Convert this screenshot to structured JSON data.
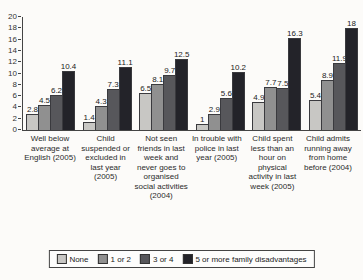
{
  "chart_data": {
    "type": "bar",
    "title": "",
    "xlabel": "",
    "ylabel": "",
    "ylim": [
      0,
      20
    ],
    "ytick_step": 2,
    "grid": false,
    "legend_position": "bottom",
    "data_labels": true,
    "categories": [
      "Well below average at English (2005)",
      "Child suspended or excluded in last year (2005)",
      "Not seen friends in last week and never goes to organised social activities (2004)",
      "In trouble with police in last year (2005)",
      "Child spent less than an hour on physical activity in last week (2005)",
      "Child admits running away from home before (2004)"
    ],
    "series": [
      {
        "name": "None",
        "color": "#c8c7c4",
        "values": [
          2.8,
          1.4,
          6.5,
          1,
          4.9,
          5.4
        ]
      },
      {
        "name": "1 or 2",
        "color": "#909090",
        "values": [
          4.5,
          4.3,
          8.1,
          2.9,
          7.7,
          8.9
        ]
      },
      {
        "name": "3 or 4",
        "color": "#57575b",
        "values": [
          6.2,
          7.3,
          9.7,
          5.6,
          7.5,
          11.9
        ]
      },
      {
        "name": "5 or more family disadvantages",
        "color": "#232329",
        "values": [
          10.4,
          11.1,
          12.5,
          10.2,
          16.3,
          18
        ]
      }
    ]
  }
}
